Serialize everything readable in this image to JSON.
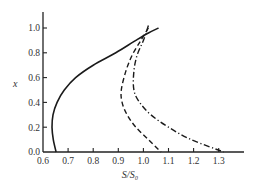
{
  "chart_data": {
    "type": "line",
    "title": "",
    "xlabel": "S/S₀",
    "ylabel": "x",
    "xlim": [
      0.6,
      1.35
    ],
    "ylim": [
      0.0,
      1.05
    ],
    "grid": false,
    "legend": null,
    "x_ticks": [
      "0.6",
      "0.7",
      "0.8",
      "0.9",
      "1.0",
      "1.1",
      "1.2",
      "1.3"
    ],
    "y_ticks": [
      "0.0",
      "0.2",
      "0.4",
      "0.6",
      "0.8",
      "1.0"
    ],
    "series": [
      {
        "name": "solid",
        "style": "solid",
        "points": [
          [
            0.652,
            0.0
          ],
          [
            0.641,
            0.1
          ],
          [
            0.636,
            0.2
          ],
          [
            0.64,
            0.3
          ],
          [
            0.656,
            0.4
          ],
          [
            0.685,
            0.5
          ],
          [
            0.73,
            0.6
          ],
          [
            0.8,
            0.7
          ],
          [
            0.89,
            0.8
          ],
          [
            0.97,
            0.9
          ],
          [
            1.02,
            0.96
          ],
          [
            1.06,
            1.0
          ]
        ]
      },
      {
        "name": "dashed",
        "style": "dashed",
        "points": [
          [
            1.02,
            1.0
          ],
          [
            0.99,
            0.9
          ],
          [
            0.955,
            0.78
          ],
          [
            0.93,
            0.65
          ],
          [
            0.912,
            0.5
          ],
          [
            0.915,
            0.4
          ],
          [
            0.935,
            0.3
          ],
          [
            0.97,
            0.2
          ],
          [
            1.02,
            0.1
          ],
          [
            1.07,
            0.0
          ]
        ]
      },
      {
        "name": "dash-dot",
        "style": "dash-dot",
        "points": [
          [
            1.02,
            1.02
          ],
          [
            1.0,
            0.9
          ],
          [
            0.975,
            0.78
          ],
          [
            0.962,
            0.65
          ],
          [
            0.962,
            0.5
          ],
          [
            0.985,
            0.4
          ],
          [
            1.03,
            0.3
          ],
          [
            1.1,
            0.2
          ],
          [
            1.19,
            0.1
          ],
          [
            1.32,
            0.0
          ]
        ]
      }
    ]
  }
}
